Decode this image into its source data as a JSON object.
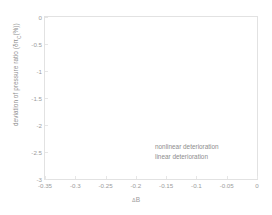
{
  "chart_data": {
    "type": "line",
    "title": "",
    "xlabel": "ΔB",
    "xlabel_symbol": "Δ",
    "xlabel_text": "B",
    "ylabel_plain": "deviation of pressure ratio (δπC(%))",
    "ylabel_prefix": "deviation of pressure ratio (δπ",
    "ylabel_subscript": "C",
    "ylabel_suffix": "(%))",
    "xlim": [
      -0.35,
      0
    ],
    "ylim": [
      -3,
      0
    ],
    "xticks": [
      "-0.35",
      "-0.3",
      "-0.25",
      "-0.2",
      "-0.15",
      "-0.1",
      "-0.05",
      "0"
    ],
    "xtick_values": [
      -0.35,
      -0.3,
      -0.25,
      -0.2,
      -0.15,
      -0.1,
      -0.05,
      0
    ],
    "yticks": [
      "0",
      "-0.5",
      "-1",
      "-1.5",
      "-2",
      "-2.5",
      "-3"
    ],
    "ytick_values": [
      0,
      -0.5,
      -1,
      -1.5,
      -2,
      -2.5,
      -3
    ],
    "grid": false,
    "legend_position": "inside-lower-right",
    "series": [
      {
        "name": "nonlinear deterioration",
        "values": []
      },
      {
        "name": "linear deterioration",
        "values": []
      }
    ],
    "annotations": [],
    "axis_color": "#e2e2e2",
    "text_color": "#9a9a9a",
    "background": "#ffffff"
  },
  "legend": {
    "entries": [
      {
        "label": "nonlinear deterioration"
      },
      {
        "label": "linear deterioration"
      }
    ]
  }
}
